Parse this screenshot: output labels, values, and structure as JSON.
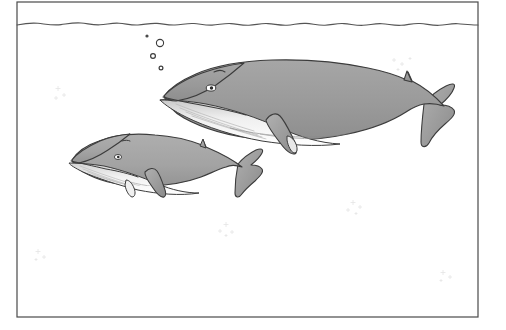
{
  "artwork": {
    "title": "Two whales swimming underwater",
    "caption": "",
    "medium": "line drawing with grey tone fill",
    "orientation": "landscape"
  },
  "canvas": {
    "width": 506,
    "height": 330,
    "background_color": "#ffffff"
  },
  "frame": {
    "name": "picture-border",
    "left": 17,
    "top": 2,
    "right": 478,
    "bottom": 317,
    "stroke_color": "#4a4a4a",
    "stroke_width": 1.2,
    "fill_color": "#ffffff"
  },
  "water_surface": {
    "label": "water-surface-line",
    "y": 25,
    "stroke_color": "#555555",
    "stroke_width": 1.1,
    "wave_path": "M17,25 C24,23.6 31,22.6 38,23.3 C46,24.1 53,25.6 61,24.6 C68,23.7 74,22.4 81,23.0 C88,23.6 93,25.2 100,24.8 C107,24.4 112,22.7 119,23.2 C126,23.7 131,25.4 138,25.0 C145,24.6 150,22.9 157,23.4 C163,23.8 168,25.3 175,25.0 C182,24.7 187,23.0 194,23.5 C200,23.9 205,25.4 212,25.1 C219,24.8 224,23.2 231,23.6 C237,24.0 242,25.5 249,25.2 C256,24.9 261,23.1 268,23.6 C275,24.1 280,25.6 287,25.2 C294,24.8 299,22.9 306,23.4 C313,23.9 318,25.5 325,25.2 C332,24.9 337,23.1 344,23.6 C351,24.1 356,25.6 363,25.3 C370,25.0 375,23.2 382,23.7 C389,24.2 394,25.7 401,25.3 C408,24.9 413,23.0 420,23.5 C427,24.0 432,25.6 439,25.3 C446,25.0 451,23.2 458,23.7 C464,24.1 471,25.2 478,25.0",
    "color_hex": "#555555"
  },
  "bubbles": [
    {
      "name": "bubble-small-top",
      "cx": 147,
      "cy": 36,
      "r": 1.6,
      "filled": true
    },
    {
      "name": "bubble-large",
      "cx": 160,
      "cy": 43,
      "r": 3.6,
      "filled": false
    },
    {
      "name": "bubble-medium",
      "cx": 153,
      "cy": 56,
      "r": 2.4,
      "filled": false
    },
    {
      "name": "bubble-small-bottom",
      "cx": 161,
      "cy": 68,
      "r": 1.9,
      "filled": false
    }
  ],
  "speck_clusters": [
    {
      "name": "speck-cluster-left-upper",
      "cx": 60,
      "cy": 90,
      "count": 4
    },
    {
      "name": "speck-cluster-left-lower",
      "cx": 40,
      "cy": 252,
      "count": 3
    },
    {
      "name": "speck-cluster-center",
      "cx": 228,
      "cy": 227,
      "count": 4
    },
    {
      "name": "speck-cluster-right",
      "cx": 355,
      "cy": 205,
      "count": 5
    },
    {
      "name": "speck-cluster-far-right",
      "cx": 445,
      "cy": 275,
      "count": 4
    },
    {
      "name": "speck-cluster-upper-right",
      "cx": 398,
      "cy": 62,
      "count": 4
    }
  ],
  "whales": [
    {
      "name": "large-whale",
      "species_hint": "baleen whale",
      "size": "large",
      "facing": "left",
      "body_color": "#9a9a9a",
      "belly_color": "#ffffff",
      "shadow_color": "#8a8a8a",
      "outline_color": "#3c3c3c",
      "bounds": {
        "x": 158,
        "y": 58,
        "width": 296,
        "height": 88
      },
      "parts": [
        "upper-jaw",
        "lower-jaw",
        "eye",
        "blowhole",
        "dorsal-fin",
        "pectoral-fin",
        "tail-fluke",
        "belly-pleats"
      ],
      "eye": {
        "cx": 211,
        "cy": 88,
        "rx": 4.6,
        "ry": 3.0
      }
    },
    {
      "name": "small-whale",
      "species_hint": "baleen whale",
      "size": "small",
      "facing": "left",
      "body_color": "#a3a3a3",
      "belly_color": "#ffffff",
      "shadow_color": "#8f8f8f",
      "outline_color": "#3c3c3c",
      "bounds": {
        "x": 66,
        "y": 133,
        "width": 200,
        "height": 62
      },
      "parts": [
        "upper-jaw",
        "lower-jaw",
        "eye",
        "blowhole",
        "dorsal-fin",
        "pectoral-fin",
        "tail-fluke",
        "belly-pleats"
      ],
      "eye": {
        "cx": 118,
        "cy": 157,
        "rx": 3.4,
        "ry": 2.4
      }
    }
  ],
  "palette": {
    "body_grey": "#9a9a9a",
    "body_grey_light": "#b4b4b4",
    "body_grey_dark": "#7d7d7d",
    "belly_white": "#ffffff",
    "outline": "#3c3c3c",
    "frame_stroke": "#4a4a4a",
    "surface_stroke": "#555555",
    "speck_grey": "#e2e2e2",
    "background": "#ffffff"
  }
}
